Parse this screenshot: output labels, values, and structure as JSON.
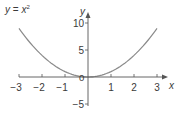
{
  "chart_data": {
    "type": "line",
    "xlabel": "x",
    "ylabel": "y",
    "xlim": [
      -3,
      3
    ],
    "ylim": [
      -5,
      10
    ],
    "x_ticks": [
      "−3",
      "−2",
      "−1",
      "1",
      "2",
      "3"
    ],
    "y_ticks": [
      "10",
      "5",
      "0",
      "−5"
    ],
    "grid": false,
    "legend": null,
    "series": [
      {
        "name": "y = x²",
        "color": "#8a8a8a",
        "x": [
          -3,
          -2.5,
          -2,
          -1.5,
          -1,
          -0.5,
          0,
          0.5,
          1,
          1.5,
          2,
          2.5,
          3
        ],
        "y": [
          9,
          6.25,
          4,
          2.25,
          1,
          0.25,
          0,
          0.25,
          1,
          2.25,
          4,
          6.25,
          9
        ]
      }
    ]
  },
  "labels": {
    "title_y": "y",
    "title_eq": " = ",
    "title_x": "x",
    "title_exp": "2",
    "x_axis": "x",
    "y_axis": "y",
    "origin": "0"
  },
  "colors": {
    "axis": "#555555",
    "curve": "#8a8a8a",
    "text": "#3a3a3a"
  }
}
